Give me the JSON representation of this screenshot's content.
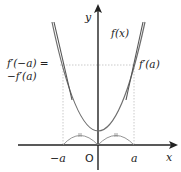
{
  "figure": {
    "axes": {
      "x_label": "x",
      "y_label": "y",
      "origin_label": "O"
    },
    "ticks": {
      "neg_a": "−a",
      "pos_a": "a"
    },
    "curve_label": "f(x)",
    "slope_label_right": "f′(a)",
    "slope_label_left_line1": "f′(−a) =",
    "slope_label_left_line2": "−f′(a)",
    "colors": {
      "axis": "#222222",
      "curve": "#6e6e6e",
      "tangent": "#555555",
      "guide": "#b8b8b8"
    }
  }
}
